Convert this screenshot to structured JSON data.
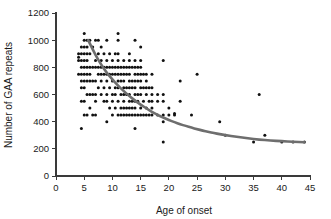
{
  "chart_data": {
    "type": "scatter",
    "title": "",
    "subtitle": "",
    "xlabel": "Age of onset",
    "ylabel": "Number of GAA repeats",
    "xlim": [
      0,
      45
    ],
    "ylim": [
      0,
      1200
    ],
    "xticks": [
      0,
      5,
      10,
      15,
      20,
      25,
      30,
      35,
      40,
      45
    ],
    "yticks": [
      0,
      200,
      400,
      600,
      800,
      1000,
      1200
    ],
    "xtick_labels": [
      "0",
      "5",
      "10",
      "15",
      "20",
      "25",
      "30",
      "35",
      "40",
      "45"
    ],
    "ytick_labels": [
      "0",
      "200",
      "400",
      "600",
      "800",
      "1000",
      "1200"
    ],
    "grid": false,
    "legend": null,
    "legend_position": "none",
    "marker": "filled-circle",
    "marker_color": "#111111",
    "curve_color": "#6e6e6e",
    "annotations": [],
    "series": [
      {
        "name": "Patients",
        "type": "scatter",
        "points": [
          [
            4,
            750
          ],
          [
            4,
            850
          ],
          [
            4,
            875
          ],
          [
            4,
            900
          ],
          [
            4.5,
            350
          ],
          [
            4.5,
            550
          ],
          [
            4.5,
            650
          ],
          [
            4.5,
            700
          ],
          [
            4.5,
            750
          ],
          [
            4.5,
            800
          ],
          [
            4.5,
            850
          ],
          [
            4.5,
            900
          ],
          [
            4.5,
            950
          ],
          [
            5,
            450
          ],
          [
            5,
            550
          ],
          [
            5,
            650
          ],
          [
            5,
            700
          ],
          [
            5,
            750
          ],
          [
            5,
            800
          ],
          [
            5,
            850
          ],
          [
            5,
            900
          ],
          [
            5,
            950
          ],
          [
            5,
            1000
          ],
          [
            5,
            1050
          ],
          [
            5.5,
            450
          ],
          [
            5.5,
            600
          ],
          [
            5.5,
            700
          ],
          [
            5.5,
            750
          ],
          [
            5.5,
            800
          ],
          [
            5.5,
            850
          ],
          [
            5.5,
            900
          ],
          [
            5.5,
            950
          ],
          [
            5.5,
            1000
          ],
          [
            6,
            500
          ],
          [
            6,
            600
          ],
          [
            6,
            700
          ],
          [
            6,
            750
          ],
          [
            6,
            800
          ],
          [
            6,
            900
          ],
          [
            6,
            1000
          ],
          [
            6.5,
            450
          ],
          [
            6.5,
            600
          ],
          [
            6.5,
            700
          ],
          [
            6.5,
            800
          ],
          [
            6.5,
            950
          ],
          [
            7,
            450
          ],
          [
            7,
            550
          ],
          [
            7,
            600
          ],
          [
            7,
            700
          ],
          [
            7,
            800
          ],
          [
            7,
            850
          ],
          [
            7,
            1000
          ],
          [
            7.5,
            650
          ],
          [
            7.5,
            750
          ],
          [
            7.5,
            800
          ],
          [
            7.5,
            900
          ],
          [
            7.5,
            1000
          ],
          [
            8,
            600
          ],
          [
            8,
            700
          ],
          [
            8,
            750
          ],
          [
            8,
            800
          ],
          [
            8,
            850
          ],
          [
            8,
            950
          ],
          [
            8.5,
            550
          ],
          [
            8.5,
            650
          ],
          [
            8.5,
            750
          ],
          [
            8.5,
            800
          ],
          [
            8.5,
            900
          ],
          [
            9,
            400
          ],
          [
            9,
            550
          ],
          [
            9,
            600
          ],
          [
            9,
            700
          ],
          [
            9,
            750
          ],
          [
            9,
            800
          ],
          [
            9,
            850
          ],
          [
            9,
            1000
          ],
          [
            9.5,
            500
          ],
          [
            9.5,
            650
          ],
          [
            9.5,
            750
          ],
          [
            9.5,
            800
          ],
          [
            9.5,
            900
          ],
          [
            10,
            450
          ],
          [
            10,
            550
          ],
          [
            10,
            600
          ],
          [
            10,
            700
          ],
          [
            10,
            750
          ],
          [
            10,
            800
          ],
          [
            10,
            850
          ],
          [
            10.5,
            500
          ],
          [
            10.5,
            600
          ],
          [
            10.5,
            650
          ],
          [
            10.5,
            750
          ],
          [
            10.5,
            800
          ],
          [
            10.5,
            900
          ],
          [
            11,
            450
          ],
          [
            11,
            550
          ],
          [
            11,
            650
          ],
          [
            11,
            700
          ],
          [
            11,
            750
          ],
          [
            11,
            800
          ],
          [
            11,
            850
          ],
          [
            11,
            900
          ],
          [
            11,
            1000
          ],
          [
            11,
            1050
          ],
          [
            11.5,
            450
          ],
          [
            11.5,
            500
          ],
          [
            11.5,
            600
          ],
          [
            11.5,
            700
          ],
          [
            11.5,
            750
          ],
          [
            11.5,
            800
          ],
          [
            12,
            450
          ],
          [
            12,
            500
          ],
          [
            12,
            550
          ],
          [
            12,
            600
          ],
          [
            12,
            650
          ],
          [
            12,
            700
          ],
          [
            12,
            750
          ],
          [
            12,
            800
          ],
          [
            12,
            850
          ],
          [
            12.5,
            450
          ],
          [
            12.5,
            500
          ],
          [
            12.5,
            600
          ],
          [
            12.5,
            650
          ],
          [
            12.5,
            750
          ],
          [
            12.5,
            800
          ],
          [
            13,
            450
          ],
          [
            13,
            500
          ],
          [
            13,
            550
          ],
          [
            13,
            600
          ],
          [
            13,
            650
          ],
          [
            13,
            700
          ],
          [
            13,
            750
          ],
          [
            13,
            800
          ],
          [
            13,
            850
          ],
          [
            13,
            900
          ],
          [
            13.5,
            450
          ],
          [
            13.5,
            500
          ],
          [
            13.5,
            550
          ],
          [
            13.5,
            650
          ],
          [
            13.5,
            700
          ],
          [
            13.5,
            800
          ],
          [
            14,
            350
          ],
          [
            14,
            450
          ],
          [
            14,
            500
          ],
          [
            14,
            550
          ],
          [
            14,
            600
          ],
          [
            14,
            650
          ],
          [
            14,
            700
          ],
          [
            14,
            750
          ],
          [
            14,
            800
          ],
          [
            14,
            850
          ],
          [
            14,
            1000
          ],
          [
            14.5,
            450
          ],
          [
            14.5,
            550
          ],
          [
            14.5,
            600
          ],
          [
            14.5,
            700
          ],
          [
            14.5,
            750
          ],
          [
            14.5,
            800
          ],
          [
            15,
            450
          ],
          [
            15,
            500
          ],
          [
            15,
            600
          ],
          [
            15,
            650
          ],
          [
            15,
            700
          ],
          [
            15,
            750
          ],
          [
            15,
            800
          ],
          [
            15,
            850
          ],
          [
            15,
            950
          ],
          [
            15.5,
            450
          ],
          [
            15.5,
            550
          ],
          [
            15.5,
            650
          ],
          [
            15.5,
            750
          ],
          [
            16,
            450
          ],
          [
            16,
            500
          ],
          [
            16,
            600
          ],
          [
            16,
            650
          ],
          [
            16,
            700
          ],
          [
            16,
            750
          ],
          [
            16.5,
            450
          ],
          [
            16.5,
            550
          ],
          [
            16.5,
            650
          ],
          [
            17,
            450
          ],
          [
            17,
            500
          ],
          [
            17,
            550
          ],
          [
            17,
            600
          ],
          [
            17,
            650
          ],
          [
            17,
            750
          ],
          [
            18,
            450
          ],
          [
            18,
            550
          ],
          [
            18,
            600
          ],
          [
            19,
            250
          ],
          [
            19,
            400
          ],
          [
            19,
            450
          ],
          [
            19,
            550
          ],
          [
            19,
            600
          ],
          [
            19,
            850
          ],
          [
            20,
            450
          ],
          [
            20,
            500
          ],
          [
            21,
            450
          ],
          [
            21,
            460
          ],
          [
            22,
            550
          ],
          [
            22,
            700
          ],
          [
            24,
            450
          ],
          [
            25,
            750
          ],
          [
            29,
            400
          ],
          [
            30,
            300
          ],
          [
            35,
            250
          ],
          [
            36,
            600
          ],
          [
            37,
            300
          ],
          [
            40,
            250
          ],
          [
            42,
            250
          ],
          [
            44,
            250
          ]
        ]
      },
      {
        "name": "Fitted exponential decay curve",
        "type": "line",
        "curve_points": [
          [
            5.7,
            1000
          ],
          [
            7,
            890
          ],
          [
            8,
            820
          ],
          [
            9,
            760
          ],
          [
            10,
            710
          ],
          [
            11,
            665
          ],
          [
            12,
            625
          ],
          [
            13,
            588
          ],
          [
            14,
            555
          ],
          [
            15,
            525
          ],
          [
            16,
            498
          ],
          [
            17,
            472
          ],
          [
            18,
            450
          ],
          [
            19,
            430
          ],
          [
            20,
            412
          ],
          [
            21,
            396
          ],
          [
            22,
            381
          ],
          [
            23,
            368
          ],
          [
            24,
            356
          ],
          [
            25,
            345
          ],
          [
            26,
            334
          ],
          [
            27,
            325
          ],
          [
            28,
            316
          ],
          [
            29,
            308
          ],
          [
            30,
            301
          ],
          [
            32,
            288
          ],
          [
            34,
            278
          ],
          [
            36,
            268
          ],
          [
            38,
            261
          ],
          [
            40,
            256
          ],
          [
            42,
            252
          ],
          [
            44,
            249
          ]
        ]
      }
    ]
  }
}
